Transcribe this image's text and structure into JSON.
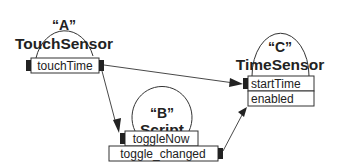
{
  "diagram": {
    "type": "route-graph",
    "colors": {
      "line": "#333333",
      "text": "#222222",
      "background": "#ffffff"
    },
    "nodes": [
      {
        "id": "A",
        "def_label": "“A”",
        "type_label": "TouchSensor",
        "fields": [
          "touchTime"
        ]
      },
      {
        "id": "B",
        "def_label": "“B”",
        "type_label": "Script",
        "fields": [
          "toggleNow",
          "toggle_changed"
        ]
      },
      {
        "id": "C",
        "def_label": "“C”",
        "type_label": "TimeSensor",
        "fields": [
          "startTime",
          "enabled"
        ]
      }
    ],
    "routes": [
      {
        "from": "A.touchTime",
        "to": "C.startTime"
      },
      {
        "from": "A.touchTime",
        "to": "B.toggleNow"
      },
      {
        "from": "B.toggle_changed",
        "to": "C.enabled"
      }
    ]
  }
}
